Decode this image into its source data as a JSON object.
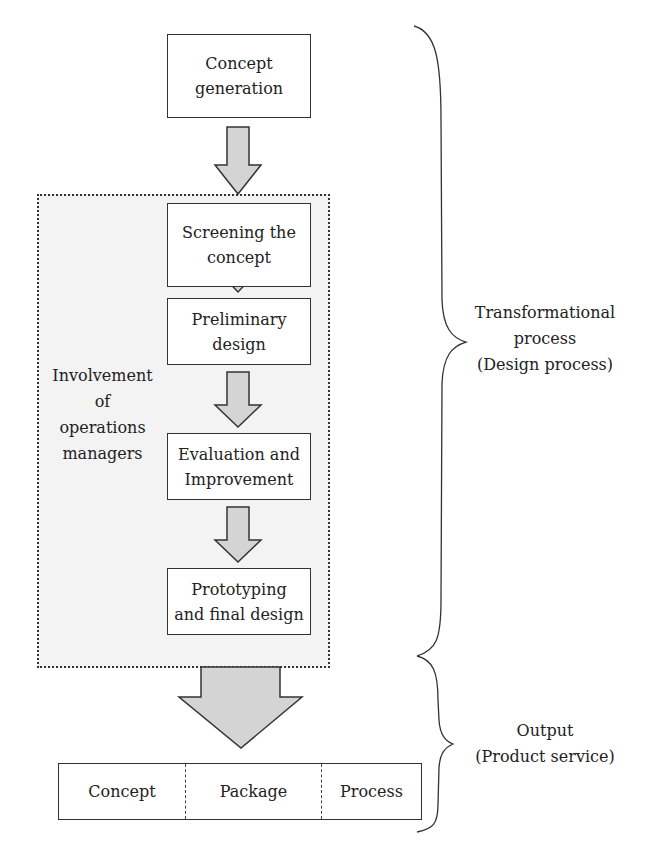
{
  "diagram": {
    "top_box": {
      "line1": "Concept",
      "line2": "generation"
    },
    "stages": [
      {
        "line1": "Screening the",
        "line2": "concept"
      },
      {
        "line1": "Preliminary",
        "line2": "design"
      },
      {
        "line1": "Evaluation and",
        "line2": "Improvement"
      },
      {
        "line1": "Prototyping",
        "line2": "and final design"
      }
    ],
    "involvement_label": [
      "Involvement",
      "of",
      "operations",
      "managers"
    ],
    "output_cells": [
      "Concept",
      "Package",
      "Process"
    ],
    "brace_labels": {
      "transformational": [
        "Transformational",
        "process",
        "(Design process)"
      ],
      "output": [
        "Output",
        "(Product service)"
      ]
    },
    "colors": {
      "arrow_fill": "#d4d4d4",
      "region_fill": "#f3f3f3",
      "stroke": "#333333"
    }
  }
}
